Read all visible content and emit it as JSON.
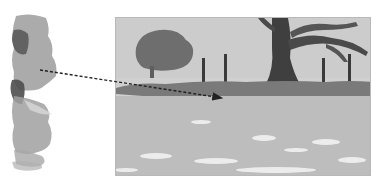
{
  "illustration": {
    "description": "Watercolor technique illustration: a vertical color swatch strip on the left with a dotted arrow pointing into a landscape painting on the right",
    "swatch": {
      "label": "color-swatch-strip",
      "colors": [
        "#9c9c9c",
        "#5a5a5a",
        "#8e8e8e",
        "#4e4e4e",
        "#a8a8a8"
      ]
    },
    "scene": {
      "label": "landscape-painting",
      "elements": [
        "distant-tree",
        "large-oak-tree",
        "fence-posts",
        "hedge-line",
        "grass-field"
      ],
      "colors": {
        "sky": "#d0d0d0",
        "distant_tree": "#6e6e6e",
        "oak_trunk": "#3f3f3f",
        "hedge": "#7a7a7a",
        "field": "#bdbdbd",
        "highlights": "#f2f2f2"
      }
    },
    "arrow": {
      "style": "dotted",
      "color": "#222222",
      "from": [
        40,
        70
      ],
      "to": [
        222,
        98
      ]
    }
  }
}
